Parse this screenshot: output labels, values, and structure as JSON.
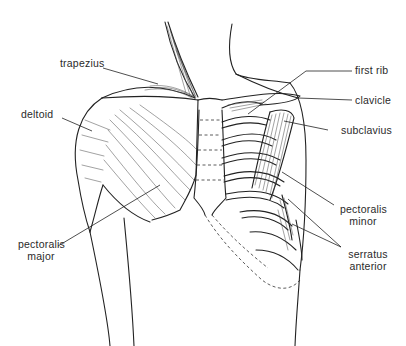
{
  "diagram": {
    "labels": {
      "trapezius": "trapezius",
      "deltoid": "deltoid",
      "pectoralis_major_1": "pectoralis",
      "pectoralis_major_2": "major",
      "first_rib": "first rib",
      "clavicle": "clavicle",
      "subclavius": "subclavius",
      "pectoralis_minor_1": "pectoralis",
      "pectoralis_minor_2": "minor",
      "serratus_anterior_1": "serratus",
      "serratus_anterior_2": "anterior"
    },
    "colors": {
      "line": "#222222",
      "text": "#2a2a2a",
      "background": "#ffffff"
    }
  }
}
